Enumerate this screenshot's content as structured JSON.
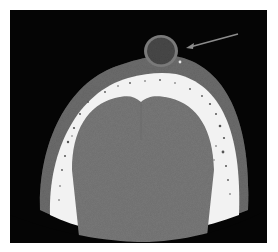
{
  "image": {
    "type": "axial CT scan of head",
    "colors": {
      "background": "#050505",
      "page": "#ffffff",
      "scalp": "#6a6a6a",
      "bone": "#f4f4f4",
      "brain": "#7a7a7a",
      "lesion": "#4a4a4a",
      "arrow": "#8a8a8a"
    }
  },
  "annotations": [
    {
      "type": "arrow",
      "target": "lesion",
      "direction": "pointing-left"
    }
  ]
}
